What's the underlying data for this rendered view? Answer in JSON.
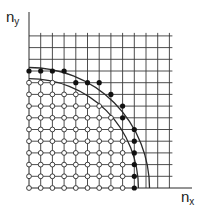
{
  "figure": {
    "type": "lattice-diagram",
    "axis_labels": {
      "x": "n",
      "x_sub": "x",
      "y": "n",
      "y_sub": "y"
    },
    "colors": {
      "line": "#2a2a2a",
      "grid": "#3a3a3a",
      "dot_filled": "#111111",
      "dot_open_fill": "#ffffff"
    },
    "geometry": {
      "origin_px": [
        29,
        188
      ],
      "unit_px": 11.7,
      "grid_cols": 12,
      "grid_rows": 13,
      "x_axis_end_px": 192,
      "y_axis_top_px": 12
    },
    "arcs": [
      {
        "name": "inner-arc",
        "radius_units": 9.35
      },
      {
        "name": "outer-arc",
        "radius_units": 10.3
      }
    ],
    "filled_points": [
      [
        0,
        10
      ],
      [
        1,
        10
      ],
      [
        2,
        10
      ],
      [
        3,
        10
      ],
      [
        4,
        9
      ],
      [
        5,
        9
      ],
      [
        6,
        9
      ],
      [
        7,
        8
      ],
      [
        8,
        7
      ],
      [
        8,
        6
      ],
      [
        9,
        5
      ],
      [
        9,
        4
      ],
      [
        9,
        3
      ],
      [
        9,
        2
      ],
      [
        9,
        1
      ],
      [
        9,
        0
      ]
    ],
    "open_region": {
      "description": "all lattice points (nx, ny) with nx>=0, ny>=0 strictly inside inner arc",
      "radius_units": 9.35
    }
  }
}
